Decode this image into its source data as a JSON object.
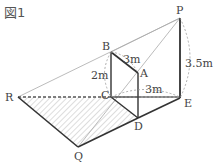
{
  "figure": {
    "title": "図1",
    "points": {
      "P": "P",
      "B": "B",
      "A": "A",
      "C": "C",
      "D": "D",
      "E": "E",
      "R": "R",
      "Q": "Q"
    },
    "measurements": {
      "BA": "3m",
      "BC": "2m",
      "CE": "3m",
      "PE": "3.5m"
    }
  }
}
